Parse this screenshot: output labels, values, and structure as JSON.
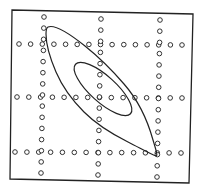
{
  "figure": {
    "colors": {
      "background": "#ffffff",
      "stroke": "#222222",
      "dot": "#333333"
    },
    "frame": {
      "corners": [
        [
          12,
          10
        ],
        [
          193,
          14
        ],
        [
          189,
          183
        ],
        [
          10,
          179
        ]
      ]
    },
    "grid": {
      "rows": [
        {
          "y_left": 44,
          "y_right": 45,
          "x_start": 19,
          "x_end": 182,
          "count": 15
        },
        {
          "y_left": 97,
          "y_right": 98,
          "x_start": 17,
          "x_end": 182,
          "count": 15
        },
        {
          "y_left": 152,
          "y_right": 153,
          "x_start": 15,
          "x_end": 181,
          "count": 15
        }
      ],
      "columns": [
        {
          "x_top": 44,
          "x_bottom": 41,
          "y_start": 17,
          "y_end": 173,
          "count": 15
        },
        {
          "x_top": 101,
          "x_bottom": 98,
          "y_start": 19,
          "y_end": 175,
          "count": 15
        },
        {
          "x_top": 160,
          "x_bottom": 157,
          "y_start": 20,
          "y_end": 177,
          "count": 15
        }
      ],
      "dot_radius": 2.3
    },
    "contours": {
      "outer": "M48,27 C55,24 70,34 85,46 C100,58 112,70 124,84 C138,100 148,122 153,140 C156,150 158,156 156,156 C150,154 140,148 128,142 C112,134 96,124 84,112 C72,100 62,86 56,72 C50,58 46,44 46,34 C46,30 46,28 48,27 Z",
      "inner": {
        "cx": 103,
        "cy": 89,
        "rx": 37,
        "ry": 13,
        "rotate": 42
      }
    }
  }
}
